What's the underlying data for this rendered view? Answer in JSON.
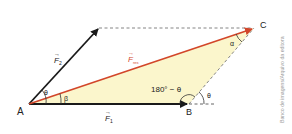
{
  "diagram": {
    "type": "vector-parallelogram",
    "points": {
      "A": {
        "label": "A",
        "x": 29,
        "y": 104
      },
      "B": {
        "label": "B",
        "x": 189,
        "y": 104
      },
      "C": {
        "label": "C",
        "x": 254,
        "y": 28
      },
      "F2_tip": {
        "x": 99,
        "y": 28
      }
    },
    "vectors": {
      "F1": {
        "label": "F",
        "subscript": "1",
        "arrow": "→"
      },
      "F2": {
        "label": "F",
        "subscript": "2",
        "arrow": "→"
      },
      "Fres": {
        "label": "F",
        "subscript": "res",
        "arrow": "→"
      }
    },
    "angles": {
      "theta_A": "θ",
      "beta": "β",
      "supplement_B": "180° − θ",
      "theta_B": "θ",
      "alpha": "α"
    },
    "colors": {
      "vector": "#1a1a1a",
      "resultant": "#d2462a",
      "triangle_fill": "#fbf6cc",
      "dashed": "#777777",
      "credit_text": "#9a9a9a"
    }
  },
  "credit": "Banco de imagens/Arquivo da editora"
}
